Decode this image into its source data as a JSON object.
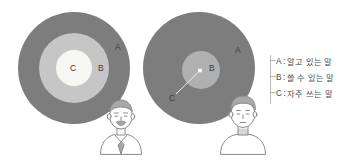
{
  "figure": {
    "left_diagram": {
      "name": "native-speaker-vocabulary-circles",
      "zones": [
        {
          "key": "A",
          "label": "A"
        },
        {
          "key": "B",
          "label": "B"
        },
        {
          "key": "C",
          "label": "C"
        }
      ]
    },
    "right_diagram": {
      "name": "learner-vocabulary-circles",
      "zones": [
        {
          "key": "A",
          "label": "A"
        },
        {
          "key": "B",
          "label": "B"
        },
        {
          "key": "C",
          "label": "C"
        }
      ]
    },
    "legend": {
      "rows": [
        {
          "key": "A",
          "separator": ":",
          "text": "알고 있는 말"
        },
        {
          "key": "B",
          "separator": ":",
          "text": "쓸 수 있는 말"
        },
        {
          "key": "C",
          "separator": ":",
          "text": "자주 쓰는 말"
        }
      ]
    },
    "colors": {
      "zone_a": "#7d7d7d",
      "zone_b_left": "#c7c7c7",
      "zone_b_right": "#b0b0b0",
      "zone_c": "#f5f5f2",
      "label_text": "#3b3b3b",
      "legend_text": "#4a4a4a",
      "bracket": "#b9b9b9",
      "person_outline": "#8a8a8a",
      "background": "#ffffff"
    }
  }
}
